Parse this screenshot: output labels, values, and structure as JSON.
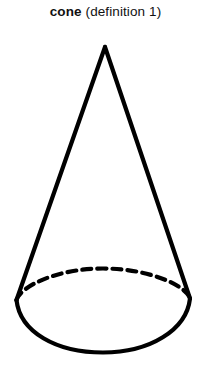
{
  "page": {
    "background_color": "#ffffff",
    "width": 211,
    "height": 379
  },
  "caption": {
    "term": "cone",
    "sense": " (definition 1)",
    "full_text": "cone (definition 1)",
    "text_color": "#111111"
  },
  "figure": {
    "name": "cone-diagram",
    "stroke_color": "#000000",
    "stroke_width": 4.2,
    "fill_color": "none",
    "apex": {
      "x": 105,
      "y": 47
    },
    "base_ellipse": {
      "center_x": 103,
      "center_y": 310,
      "radius_x": 87,
      "radius_y": 42
    },
    "left_tangent_point": {
      "x": 16,
      "y": 300
    },
    "right_tangent_point": {
      "x": 190,
      "y": 298
    },
    "visible_base_arc_style": "solid",
    "hidden_base_arc_style": "dashed",
    "dash_pattern": "9 6",
    "paths": {
      "left_slant": "M 105 47 L 16.5 300",
      "right_slant": "M 105 47 L 190 298.5",
      "front_arc": "M 16.5 300 C 20 332 56 352.5 103 352.5 C 150 352.5 186.5 330 190 298.5",
      "back_arc": "M 16.5 300 C 20 287 56 268.5 103 268.5 C 150 268.5 186.5 286 190 298.5"
    }
  }
}
